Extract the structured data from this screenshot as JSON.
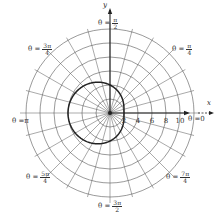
{
  "chart_data": {
    "type": "polar",
    "title": "",
    "curve": {
      "equation": "r = 4 - 2cos(theta)",
      "color": "#222222"
    },
    "origin_px": [
      110,
      113
    ],
    "px_per_unit": 7,
    "circle_radii": [
      2,
      4,
      6,
      8,
      10,
      12
    ],
    "ray_step_deg": 15,
    "x_ticks": [
      "2",
      "4",
      "6",
      "8",
      "10"
    ],
    "x_axis_label": "x",
    "y_axis_label": "y",
    "angle_labels": [
      {
        "id": "0",
        "prefix": "θ = ",
        "text": "0"
      },
      {
        "id": "pi4",
        "prefix": "θ = ",
        "num": "π",
        "den": "4"
      },
      {
        "id": "pi2",
        "prefix": "θ = ",
        "num": "π",
        "den": "2"
      },
      {
        "id": "3pi4",
        "prefix": "θ = ",
        "num": "3π",
        "den": "4"
      },
      {
        "id": "pi",
        "prefix": "θ = ",
        "text": "π"
      },
      {
        "id": "5pi4",
        "prefix": "θ = ",
        "num": "5π",
        "den": "4"
      },
      {
        "id": "3pi2",
        "prefix": "θ = ",
        "num": "3π",
        "den": "2"
      },
      {
        "id": "7pi4",
        "prefix": "θ = ",
        "num": "7π",
        "den": "4"
      }
    ]
  },
  "colors": {
    "grid": "#555555",
    "axis": "#222222",
    "curve": "#222222"
  }
}
